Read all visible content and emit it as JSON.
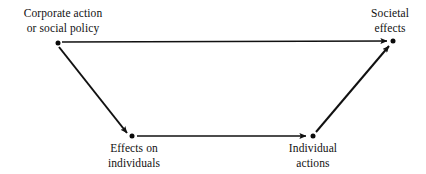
{
  "diagram": {
    "background_color": "#ffffff",
    "line_color": "#111111",
    "text_color": "#111111",
    "nodes": [
      {
        "id": "corporate-action",
        "label_line1": "Corporate action",
        "label_line2": "or social policy",
        "x": 58,
        "y": 43,
        "label_x": 63,
        "label_y": 6,
        "label_position": "above"
      },
      {
        "id": "societal-effects",
        "label_line1": "Societal",
        "label_line2": "effects",
        "x": 393,
        "y": 41,
        "label_x": 390,
        "label_y": 6,
        "label_position": "above"
      },
      {
        "id": "effects-on-individuals",
        "label_line1": "Effects on",
        "label_line2": "individuals",
        "x": 132,
        "y": 136,
        "label_x": 134,
        "label_y": 141,
        "label_position": "below"
      },
      {
        "id": "individual-actions",
        "label_line1": "Individual",
        "label_line2": "actions",
        "x": 313,
        "y": 136,
        "label_x": 313,
        "label_y": 141,
        "label_position": "below"
      }
    ],
    "edges": [
      {
        "id": "corporate-action-to-societal-effects",
        "from": "corporate-action",
        "to": "societal-effects",
        "x1": 62,
        "y1": 42,
        "x2": 387,
        "y2": 41,
        "arrow": true
      },
      {
        "id": "corporate-action-to-effects-on-individuals",
        "from": "corporate-action",
        "to": "effects-on-individuals",
        "x1": 59,
        "y1": 47,
        "x2": 127,
        "y2": 133,
        "arrow": true
      },
      {
        "id": "effects-on-individuals-to-individual-actions",
        "from": "effects-on-individuals",
        "to": "individual-actions",
        "x1": 137,
        "y1": 136,
        "x2": 306,
        "y2": 136,
        "arrow": true
      },
      {
        "id": "individual-actions-to-societal-effects",
        "from": "individual-actions",
        "to": "societal-effects",
        "x1": 316,
        "y1": 132,
        "x2": 389,
        "y2": 46,
        "arrow": true
      }
    ]
  }
}
